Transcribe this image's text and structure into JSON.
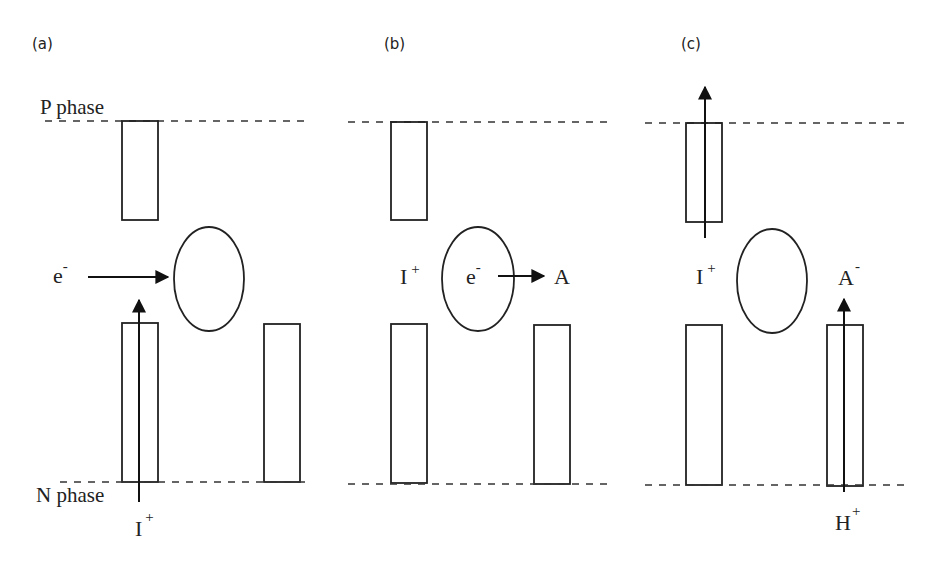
{
  "panels": [
    {
      "label": "(a)",
      "phase_top_label": "P phase",
      "phase_bottom_label": "N phase",
      "species": {
        "electron": {
          "base": "e",
          "sup": "-"
        },
        "ion_bottom": {
          "base": "I",
          "sup": "+"
        }
      },
      "arrows": [
        {
          "name": "electron-to-drop",
          "direction": "right"
        },
        {
          "name": "ion-through-channel",
          "direction": "up"
        }
      ]
    },
    {
      "label": "(b)",
      "species": {
        "ion_left": {
          "base": "I",
          "sup": "+"
        },
        "electron_in_drop": {
          "base": "e",
          "sup": "-"
        },
        "acceptor": {
          "base": "A",
          "sup": ""
        }
      },
      "arrows": [
        {
          "name": "electron-to-acceptor",
          "direction": "right"
        }
      ]
    },
    {
      "label": "(c)",
      "species": {
        "ion_left": {
          "base": "I",
          "sup": "+"
        },
        "acceptor_anion": {
          "base": "A",
          "sup": "-"
        },
        "proton": {
          "base": "H",
          "sup": "+"
        }
      },
      "arrows": [
        {
          "name": "ion-exit-top-channel",
          "direction": "up"
        },
        {
          "name": "proton-through-channel",
          "direction": "up"
        }
      ]
    }
  ],
  "colors": {
    "line": "#222222",
    "background": "#ffffff"
  }
}
